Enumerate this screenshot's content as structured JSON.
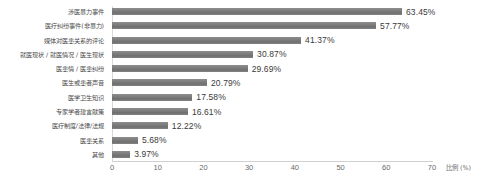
{
  "chart_data": {
    "type": "bar",
    "orientation": "horizontal",
    "title": "",
    "xlabel": "比例 (%)",
    "ylabel": "",
    "xlim": [
      0,
      70
    ],
    "ylim": null,
    "grid": false,
    "legend": null,
    "xticks": [
      "0",
      "10",
      "20",
      "30",
      "40",
      "50",
      "60",
      "70"
    ],
    "xtick_values": [
      0,
      10,
      20,
      30,
      40,
      50,
      60,
      70
    ],
    "categories": [
      "涉医暴力事件",
      "医疗纠纷事件(非暴力)",
      "媒体对医患关系的评论",
      "就医现状 / 就医情况 / 医生现状",
      "医患情 / 医患纠纷",
      "医生或患者声音",
      "医学卫生知识",
      "专家学者建言献策",
      "医疗制度/法律/法规",
      "医患关系",
      "其他"
    ],
    "values": [
      63.45,
      57.77,
      41.37,
      30.87,
      29.69,
      20.79,
      17.58,
      16.61,
      12.22,
      5.68,
      3.97
    ],
    "value_labels": [
      "63.45%",
      "57.77%",
      "41.37%",
      "30.87%",
      "29.69%",
      "20.79%",
      "17.58%",
      "16.61%",
      "12.22%",
      "5.68%",
      "3.97%"
    ],
    "bar_color": "#7f7f7f",
    "background_color": "#ffffff",
    "axis_color": "#d0d0d0",
    "label_color": "#4a4a4a",
    "value_color": "#3a3a3a"
  }
}
